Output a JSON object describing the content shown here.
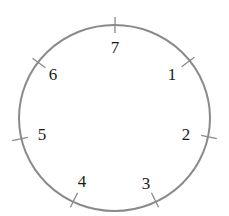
{
  "diagram": {
    "type": "circle-with-numbered-points",
    "circle": {
      "cx": 114.5,
      "cy": 118,
      "rx": 95.5,
      "ry": 93,
      "stroke": "#8a8a8a"
    },
    "points": [
      {
        "label": "1",
        "tick": [
          188,
          62
        ],
        "text": [
          172,
          80
        ]
      },
      {
        "label": "2",
        "tick": [
          209,
          137
        ],
        "text": [
          186,
          140
        ]
      },
      {
        "label": "3",
        "tick": [
          155,
          200
        ],
        "text": [
          146,
          189
        ]
      },
      {
        "label": "4",
        "tick": [
          74,
          200
        ],
        "text": [
          82,
          187
        ]
      },
      {
        "label": "5",
        "tick": [
          20,
          139
        ],
        "text": [
          42,
          140
        ]
      },
      {
        "label": "6",
        "tick": [
          39,
          63
        ],
        "text": [
          53,
          80
        ]
      },
      {
        "label": "7",
        "tick": [
          115,
          25
        ],
        "text": [
          115,
          53
        ]
      }
    ]
  }
}
